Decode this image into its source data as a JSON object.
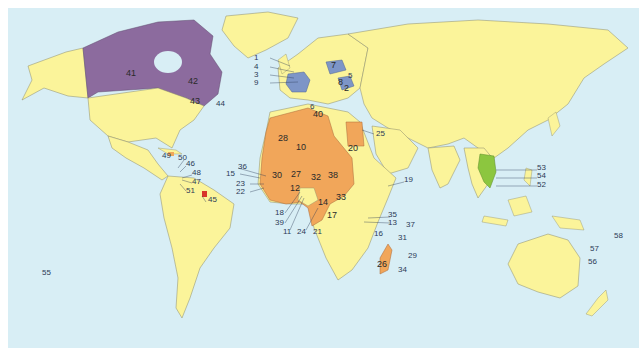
{
  "map": {
    "type": "world-map",
    "ocean_color": "#d8eef5",
    "legend_colors": {
      "other_land": "#fbf49a",
      "north_america_members": "#8c6b9e",
      "europe_members": "#7d95c7",
      "africa_members": "#f1a65a",
      "asia_members": "#8cc63f",
      "french_guiana_marker": "#d8352a"
    },
    "labels": [
      {
        "id": "1",
        "x": 254,
        "y": 50
      },
      {
        "id": "4",
        "x": 254,
        "y": 59
      },
      {
        "id": "3",
        "x": 254,
        "y": 67
      },
      {
        "id": "9",
        "x": 254,
        "y": 75
      },
      {
        "id": "7",
        "x": 327,
        "y": 57
      },
      {
        "id": "5",
        "x": 339,
        "y": 66
      },
      {
        "id": "8",
        "x": 332,
        "y": 74
      },
      {
        "id": "2",
        "x": 336,
        "y": 80
      },
      {
        "id": "6",
        "x": 302,
        "y": 97
      },
      {
        "id": "40",
        "x": 307,
        "y": 104
      },
      {
        "id": "41",
        "x": 122,
        "y": 65
      },
      {
        "id": "42",
        "x": 184,
        "y": 73
      },
      {
        "id": "43",
        "x": 186,
        "y": 92
      },
      {
        "id": "44",
        "x": 211,
        "y": 95
      },
      {
        "id": "49",
        "x": 157,
        "y": 148
      },
      {
        "id": "50",
        "x": 172,
        "y": 150
      },
      {
        "id": "46",
        "x": 180,
        "y": 156
      },
      {
        "id": "48",
        "x": 186,
        "y": 165
      },
      {
        "id": "47",
        "x": 186,
        "y": 174
      },
      {
        "id": "51",
        "x": 180,
        "y": 183
      },
      {
        "id": "45",
        "x": 200,
        "y": 192
      },
      {
        "id": "28",
        "x": 273,
        "y": 130
      },
      {
        "id": "10",
        "x": 290,
        "y": 139
      },
      {
        "id": "20",
        "x": 342,
        "y": 140
      },
      {
        "id": "36",
        "x": 234,
        "y": 159
      },
      {
        "id": "15",
        "x": 222,
        "y": 166
      },
      {
        "id": "30",
        "x": 267,
        "y": 167
      },
      {
        "id": "27",
        "x": 286,
        "y": 166
      },
      {
        "id": "32",
        "x": 306,
        "y": 169
      },
      {
        "id": "38",
        "x": 323,
        "y": 167
      },
      {
        "id": "23",
        "x": 232,
        "y": 176
      },
      {
        "id": "22",
        "x": 232,
        "y": 184
      },
      {
        "id": "12",
        "x": 284,
        "y": 180
      },
      {
        "id": "33",
        "x": 330,
        "y": 189
      },
      {
        "id": "14",
        "x": 313,
        "y": 194
      },
      {
        "id": "17",
        "x": 321,
        "y": 207
      },
      {
        "id": "18",
        "x": 271,
        "y": 205
      },
      {
        "id": "39",
        "x": 271,
        "y": 215
      },
      {
        "id": "11",
        "x": 278,
        "y": 224
      },
      {
        "id": "24",
        "x": 292,
        "y": 224
      },
      {
        "id": "21",
        "x": 308,
        "y": 224
      },
      {
        "id": "25",
        "x": 372,
        "y": 126
      },
      {
        "id": "19",
        "x": 397,
        "y": 172
      },
      {
        "id": "35",
        "x": 383,
        "y": 207
      },
      {
        "id": "13",
        "x": 383,
        "y": 214
      },
      {
        "id": "37",
        "x": 401,
        "y": 217
      },
      {
        "id": "16",
        "x": 369,
        "y": 226
      },
      {
        "id": "31",
        "x": 392,
        "y": 229
      },
      {
        "id": "29",
        "x": 403,
        "y": 248
      },
      {
        "id": "26",
        "x": 373,
        "y": 256
      },
      {
        "id": "34",
        "x": 393,
        "y": 262
      },
      {
        "id": "53",
        "x": 531,
        "y": 160
      },
      {
        "id": "54",
        "x": 531,
        "y": 168
      },
      {
        "id": "52",
        "x": 531,
        "y": 177
      },
      {
        "id": "58",
        "x": 608,
        "y": 228
      },
      {
        "id": "57",
        "x": 585,
        "y": 241
      },
      {
        "id": "56",
        "x": 583,
        "y": 254
      },
      {
        "id": "55",
        "x": 38,
        "y": 265
      }
    ]
  }
}
